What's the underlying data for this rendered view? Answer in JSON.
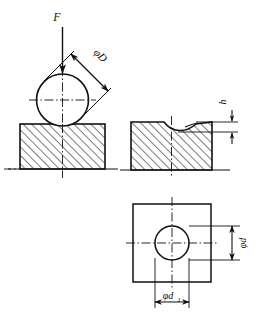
{
  "figure": {
    "type": "engineering-drawing",
    "line_color": "#111111",
    "background_color": "#ffffff",
    "hatch_color": "#111111"
  },
  "views": {
    "left": {
      "name": "loading-view",
      "labels": {
        "force": "F",
        "ball_diameter": "φD"
      }
    },
    "right": {
      "name": "indentation-view",
      "labels": {
        "depth": "h"
      }
    },
    "bottom": {
      "name": "plan-view",
      "labels": {
        "impression_diameter": "φd",
        "impression_diameter_1": "φd",
        "impression_diameter_1_sub": "1"
      }
    }
  }
}
